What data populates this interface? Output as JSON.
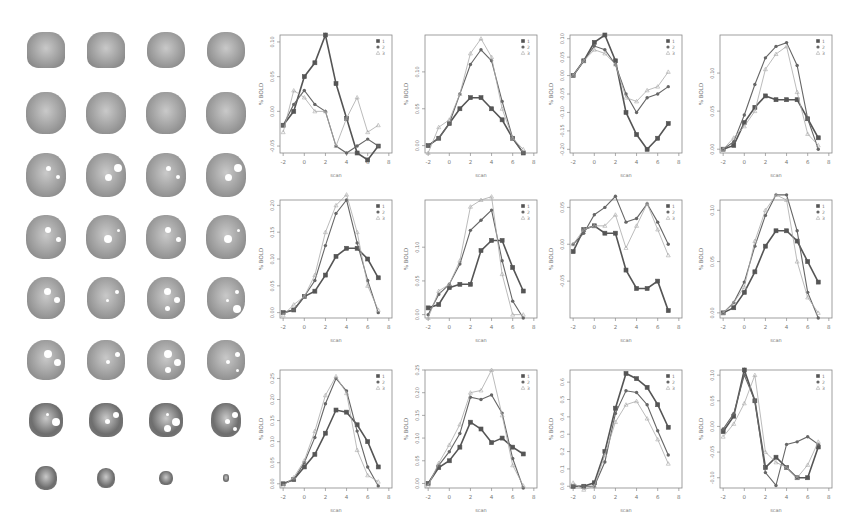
{
  "figure": {
    "brain_grid": {
      "rows": 8,
      "cols": 4,
      "description": "axial brain slices with white activation overlays"
    },
    "x_axis_label": "scan",
    "y_axis_label": "% BOLD",
    "legend": [
      "1",
      "2",
      "3"
    ],
    "legend_markers": [
      "square",
      "circle",
      "triangle"
    ]
  },
  "chart_data": [
    {
      "type": "line",
      "title": "",
      "xlabel": "scan",
      "ylabel": "% BOLD",
      "xlim": [
        -2,
        8
      ],
      "ylim": [
        -0.06,
        0.11
      ],
      "yticks": [
        "-0.05",
        "0.00",
        "0.05",
        "0.10"
      ],
      "xticks": [
        "-2",
        "0",
        "2",
        "4",
        "6",
        "8"
      ],
      "legend": [
        "1",
        "2",
        "3"
      ],
      "x": [
        -2,
        -1,
        0,
        1,
        2,
        3,
        4,
        5,
        6,
        7
      ],
      "series": [
        {
          "name": "1",
          "values": [
            -0.02,
            0.0,
            0.05,
            0.07,
            0.11,
            0.04,
            -0.01,
            -0.06,
            -0.07,
            -0.05
          ]
        },
        {
          "name": "2",
          "values": [
            -0.02,
            0.01,
            0.03,
            0.01,
            0.0,
            -0.05,
            -0.06,
            -0.05,
            -0.04,
            -0.05
          ]
        },
        {
          "name": "3",
          "values": [
            -0.03,
            0.03,
            0.02,
            0.0,
            0.0,
            -0.05,
            -0.01,
            0.02,
            -0.03,
            -0.02
          ]
        }
      ]
    },
    {
      "type": "line",
      "title": "",
      "xlabel": "scan",
      "ylabel": "% BOLD",
      "xlim": [
        -2,
        8
      ],
      "ylim": [
        -0.01,
        0.15
      ],
      "yticks": [
        "0.00",
        "0.05",
        "0.10"
      ],
      "xticks": [
        "-2",
        "0",
        "2",
        "4",
        "6",
        "8"
      ],
      "legend": [
        "1",
        "2",
        "3"
      ],
      "x": [
        -2,
        -1,
        0,
        1,
        2,
        3,
        4,
        5,
        6,
        7
      ],
      "series": [
        {
          "name": "1",
          "values": [
            0.0,
            0.01,
            0.03,
            0.05,
            0.065,
            0.065,
            0.05,
            0.035,
            0.01,
            -0.01
          ]
        },
        {
          "name": "2",
          "values": [
            0.0,
            0.01,
            0.03,
            0.07,
            0.11,
            0.13,
            0.115,
            0.06,
            0.01,
            -0.01
          ]
        },
        {
          "name": "3",
          "values": [
            -0.01,
            0.025,
            0.035,
            0.07,
            0.125,
            0.145,
            0.12,
            0.05,
            0.01,
            -0.005
          ]
        }
      ]
    },
    {
      "type": "line",
      "title": "",
      "xlabel": "scan",
      "ylabel": "% BOLD",
      "xlim": [
        -2,
        8
      ],
      "ylim": [
        -0.21,
        0.11
      ],
      "yticks": [
        "-0.20",
        "-0.15",
        "-0.10",
        "-0.05",
        "0.00",
        "0.05",
        "0.10"
      ],
      "xticks": [
        "-2",
        "0",
        "2",
        "4",
        "6",
        "8"
      ],
      "legend": [
        "1",
        "2",
        "3"
      ],
      "x": [
        -2,
        -1,
        0,
        1,
        2,
        3,
        4,
        5,
        6,
        7
      ],
      "series": [
        {
          "name": "1",
          "values": [
            0.0,
            0.04,
            0.09,
            0.11,
            0.04,
            -0.1,
            -0.16,
            -0.2,
            -0.17,
            -0.13
          ]
        },
        {
          "name": "2",
          "values": [
            0.0,
            0.04,
            0.08,
            0.07,
            0.03,
            -0.05,
            -0.1,
            -0.06,
            -0.05,
            -0.03
          ]
        },
        {
          "name": "3",
          "values": [
            0.0,
            0.04,
            0.07,
            0.06,
            0.03,
            -0.06,
            -0.07,
            -0.04,
            -0.03,
            0.01
          ]
        }
      ]
    },
    {
      "type": "line",
      "title": "",
      "xlabel": "scan",
      "ylabel": "% BOLD",
      "xlim": [
        -2,
        8
      ],
      "ylim": [
        -0.005,
        0.15
      ],
      "yticks": [
        "0.00",
        "0.05",
        "0.10"
      ],
      "xticks": [
        "-2",
        "0",
        "2",
        "4",
        "6",
        "8"
      ],
      "legend": [
        "1",
        "2",
        "3"
      ],
      "x": [
        -2,
        -1,
        0,
        1,
        2,
        3,
        4,
        5,
        6,
        7
      ],
      "series": [
        {
          "name": "1",
          "values": [
            0.0,
            0.005,
            0.035,
            0.055,
            0.07,
            0.065,
            0.065,
            0.065,
            0.04,
            0.015
          ]
        },
        {
          "name": "2",
          "values": [
            0.0,
            0.01,
            0.045,
            0.085,
            0.12,
            0.135,
            0.14,
            0.11,
            0.04,
            0.0
          ]
        },
        {
          "name": "3",
          "values": [
            0.0,
            0.015,
            0.03,
            0.05,
            0.105,
            0.125,
            0.135,
            0.075,
            0.02,
            0.005
          ]
        }
      ]
    },
    {
      "type": "line",
      "title": "",
      "xlabel": "scan",
      "ylabel": "% BOLD",
      "xlim": [
        -2,
        8
      ],
      "ylim": [
        -0.01,
        0.21
      ],
      "yticks": [
        "0.00",
        "0.05",
        "0.10",
        "0.15",
        "0.20"
      ],
      "xticks": [
        "-2",
        "0",
        "2",
        "4",
        "6",
        "8"
      ],
      "legend": [
        "1",
        "2",
        "3"
      ],
      "x": [
        -2,
        -1,
        0,
        1,
        2,
        3,
        4,
        5,
        6,
        7
      ],
      "series": [
        {
          "name": "1",
          "values": [
            0.0,
            0.005,
            0.03,
            0.04,
            0.07,
            0.105,
            0.12,
            0.12,
            0.1,
            0.065
          ]
        },
        {
          "name": "2",
          "values": [
            0.0,
            0.005,
            0.03,
            0.06,
            0.125,
            0.185,
            0.21,
            0.13,
            0.06,
            0.0
          ]
        },
        {
          "name": "3",
          "values": [
            -0.005,
            0.015,
            0.03,
            0.07,
            0.15,
            0.2,
            0.22,
            0.15,
            0.05,
            0.005
          ]
        }
      ]
    },
    {
      "type": "line",
      "title": "",
      "xlabel": "scan",
      "ylabel": "% BOLD",
      "xlim": [
        -2,
        8
      ],
      "ylim": [
        -0.005,
        0.17
      ],
      "yticks": [
        "0.00",
        "0.05",
        "0.10"
      ],
      "xticks": [
        "-2",
        "0",
        "2",
        "4",
        "6",
        "8"
      ],
      "legend": [
        "1",
        "2",
        "3"
      ],
      "x": [
        -2,
        -1,
        0,
        1,
        2,
        3,
        4,
        5,
        6,
        7
      ],
      "series": [
        {
          "name": "1",
          "values": [
            0.01,
            0.015,
            0.04,
            0.045,
            0.045,
            0.095,
            0.11,
            0.11,
            0.07,
            0.035
          ]
        },
        {
          "name": "2",
          "values": [
            0.0,
            0.03,
            0.045,
            0.075,
            0.125,
            0.14,
            0.155,
            0.08,
            0.02,
            -0.005
          ]
        },
        {
          "name": "3",
          "values": [
            -0.005,
            0.035,
            0.045,
            0.08,
            0.16,
            0.17,
            0.175,
            0.06,
            0.0,
            0.0
          ]
        }
      ]
    },
    {
      "type": "line",
      "title": "",
      "xlabel": "scan",
      "ylabel": "% BOLD",
      "xlim": [
        -2,
        8
      ],
      "ylim": [
        -0.1,
        0.06
      ],
      "yticks": [
        "-0.05",
        "0.00",
        "0.05"
      ],
      "xticks": [
        "-2",
        "0",
        "2",
        "4",
        "6",
        "8"
      ],
      "legend": [
        "1",
        "2",
        "3"
      ],
      "x": [
        -2,
        -1,
        0,
        1,
        2,
        3,
        4,
        5,
        6,
        7
      ],
      "series": [
        {
          "name": "1",
          "values": [
            -0.01,
            0.02,
            0.025,
            0.015,
            0.015,
            -0.035,
            -0.06,
            -0.06,
            -0.05,
            -0.09
          ]
        },
        {
          "name": "2",
          "values": [
            0.0,
            0.015,
            0.04,
            0.05,
            0.065,
            0.03,
            0.035,
            0.055,
            0.03,
            -0.0
          ]
        },
        {
          "name": "3",
          "values": [
            0.0,
            0.02,
            0.025,
            0.025,
            0.04,
            -0.005,
            0.025,
            0.055,
            0.02,
            -0.015
          ]
        }
      ]
    },
    {
      "type": "line",
      "title": "",
      "xlabel": "scan",
      "ylabel": "% BOLD",
      "xlim": [
        -2,
        8
      ],
      "ylim": [
        -0.005,
        0.11
      ],
      "yticks": [
        "0.00",
        "0.05",
        "0.10"
      ],
      "xticks": [
        "-2",
        "0",
        "2",
        "4",
        "6",
        "8"
      ],
      "legend": [
        "1",
        "2",
        "3"
      ],
      "x": [
        -2,
        -1,
        0,
        1,
        2,
        3,
        4,
        5,
        6,
        7
      ],
      "series": [
        {
          "name": "1",
          "values": [
            0.0,
            0.005,
            0.02,
            0.04,
            0.065,
            0.08,
            0.08,
            0.07,
            0.05,
            0.03
          ]
        },
        {
          "name": "2",
          "values": [
            0.0,
            0.01,
            0.03,
            0.065,
            0.095,
            0.115,
            0.115,
            0.08,
            0.02,
            -0.005
          ]
        },
        {
          "name": "3",
          "values": [
            0.0,
            0.01,
            0.025,
            0.07,
            0.1,
            0.115,
            0.11,
            0.05,
            0.015,
            0.0
          ]
        }
      ]
    },
    {
      "type": "line",
      "title": "",
      "xlabel": "scan",
      "ylabel": "% BOLD",
      "xlim": [
        -2,
        8
      ],
      "ylim": [
        -0.01,
        0.27
      ],
      "yticks": [
        "0.00",
        "0.05",
        "0.10",
        "0.15",
        "0.20",
        "0.25"
      ],
      "xticks": [
        "-2",
        "0",
        "2",
        "4",
        "6",
        "8"
      ],
      "legend": [
        "1",
        "2",
        "3"
      ],
      "x": [
        -2,
        -1,
        0,
        1,
        2,
        3,
        4,
        5,
        6,
        7
      ],
      "series": [
        {
          "name": "1",
          "values": [
            0.0,
            0.01,
            0.04,
            0.07,
            0.12,
            0.175,
            0.17,
            0.14,
            0.1,
            0.04
          ]
        },
        {
          "name": "2",
          "values": [
            0.0,
            0.01,
            0.05,
            0.11,
            0.19,
            0.25,
            0.22,
            0.125,
            0.04,
            -0.005
          ]
        },
        {
          "name": "3",
          "values": [
            -0.005,
            0.015,
            0.055,
            0.125,
            0.21,
            0.255,
            0.215,
            0.08,
            0.02,
            0.005
          ]
        }
      ]
    },
    {
      "type": "line",
      "title": "",
      "xlabel": "scan",
      "ylabel": "% BOLD",
      "xlim": [
        -2,
        8
      ],
      "ylim": [
        -0.01,
        0.25
      ],
      "yticks": [
        "0.00",
        "0.05",
        "0.10",
        "0.15",
        "0.20",
        "0.25"
      ],
      "xticks": [
        "-2",
        "0",
        "2",
        "4",
        "6",
        "8"
      ],
      "legend": [
        "1",
        "2",
        "3"
      ],
      "x": [
        -2,
        -1,
        0,
        1,
        2,
        3,
        4,
        5,
        6,
        7
      ],
      "series": [
        {
          "name": "1",
          "values": [
            0.0,
            0.035,
            0.05,
            0.08,
            0.135,
            0.12,
            0.09,
            0.1,
            0.08,
            0.065
          ]
        },
        {
          "name": "2",
          "values": [
            0.0,
            0.04,
            0.07,
            0.11,
            0.19,
            0.185,
            0.195,
            0.155,
            0.055,
            -0.01
          ]
        },
        {
          "name": "3",
          "values": [
            -0.005,
            0.045,
            0.085,
            0.13,
            0.2,
            0.205,
            0.25,
            0.15,
            0.04,
            -0.005
          ]
        }
      ]
    },
    {
      "type": "line",
      "title": "",
      "xlabel": "scan",
      "ylabel": "% BOLD",
      "xlim": [
        -2,
        8
      ],
      "ylim": [
        -0.01,
        0.67
      ],
      "yticks": [
        "0.0",
        "0.1",
        "0.2",
        "0.3",
        "0.4",
        "0.5",
        "0.6"
      ],
      "xticks": [
        "-2",
        "0",
        "2",
        "4",
        "6",
        "8"
      ],
      "legend": [
        "1",
        "2",
        "3"
      ],
      "x": [
        -2,
        -1,
        0,
        1,
        2,
        3,
        4,
        5,
        6,
        7
      ],
      "series": [
        {
          "name": "1",
          "values": [
            0.0,
            0.0,
            0.02,
            0.2,
            0.45,
            0.65,
            0.62,
            0.57,
            0.47,
            0.34
          ]
        },
        {
          "name": "2",
          "values": [
            0.0,
            0.0,
            0.0,
            0.14,
            0.42,
            0.55,
            0.54,
            0.47,
            0.32,
            0.18
          ]
        },
        {
          "name": "3",
          "values": [
            0.02,
            -0.02,
            0.0,
            0.18,
            0.37,
            0.47,
            0.49,
            0.39,
            0.27,
            0.13
          ]
        }
      ]
    },
    {
      "type": "line",
      "title": "",
      "xlabel": "scan",
      "ylabel": "% BOLD",
      "xlim": [
        -2,
        8
      ],
      "ylim": [
        -0.12,
        0.11
      ],
      "yticks": [
        "-0.10",
        "-0.05",
        "0.00",
        "0.05",
        "0.10"
      ],
      "xticks": [
        "-2",
        "0",
        "2",
        "4",
        "6",
        "8"
      ],
      "legend": [
        "1",
        "2",
        "3"
      ],
      "x": [
        -2,
        -1,
        0,
        1,
        2,
        3,
        4,
        5,
        6,
        7
      ],
      "series": [
        {
          "name": "1",
          "values": [
            -0.01,
            0.02,
            0.11,
            0.05,
            -0.08,
            -0.06,
            -0.08,
            -0.1,
            -0.1,
            -0.04
          ]
        },
        {
          "name": "2",
          "values": [
            -0.005,
            0.025,
            0.1,
            0.05,
            -0.09,
            -0.115,
            -0.035,
            -0.03,
            -0.02,
            -0.035
          ]
        },
        {
          "name": "3",
          "values": [
            -0.02,
            0.005,
            0.045,
            0.1,
            -0.05,
            -0.07,
            -0.08,
            -0.1,
            -0.075,
            -0.03
          ]
        }
      ]
    }
  ]
}
